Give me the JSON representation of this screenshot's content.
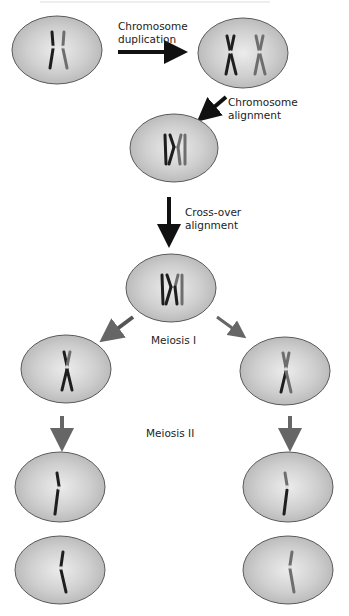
{
  "diagram": {
    "title": "",
    "labels": {
      "duplication": [
        "Chromosome",
        "duplication"
      ],
      "alignment": [
        "Chromosome",
        "alignment"
      ],
      "crossover": [
        "Cross-over",
        "alignment"
      ],
      "meiosis1": "Meiosis I",
      "meiosis2": "Meiosis II"
    },
    "colors": {
      "cell_fill_center": "#e6e6e6",
      "cell_fill_edge": "#b8b8b8",
      "cell_stroke": "#5a5a5a",
      "chromosome_dark": "#1e1e1e",
      "chromosome_grey": "#6e6e6e",
      "arrow_black": "#111111",
      "arrow_grey": "#666666"
    },
    "nodes": [
      {
        "id": "parent-cell",
        "stage": "Initial cell"
      },
      {
        "id": "duplicated-cell",
        "stage": "After chromosome duplication"
      },
      {
        "id": "aligned-cell",
        "stage": "After chromosome alignment"
      },
      {
        "id": "crossover-cell",
        "stage": "After cross-over alignment"
      },
      {
        "id": "meiosis1-left-cell",
        "stage": "Meiosis I daughter (left)"
      },
      {
        "id": "meiosis1-right-cell",
        "stage": "Meiosis I daughter (right)"
      },
      {
        "id": "meiosis2-left-top-cell",
        "stage": "Meiosis II gamete"
      },
      {
        "id": "meiosis2-left-bottom-cell",
        "stage": "Meiosis II gamete"
      },
      {
        "id": "meiosis2-right-top-cell",
        "stage": "Meiosis II gamete"
      },
      {
        "id": "meiosis2-right-bottom-cell",
        "stage": "Meiosis II gamete"
      }
    ]
  }
}
